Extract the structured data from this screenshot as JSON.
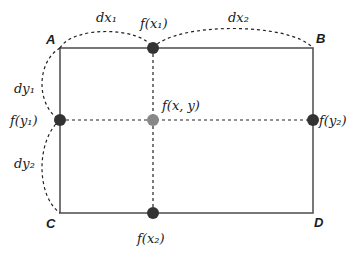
{
  "diagram": {
    "corners": {
      "A": "A",
      "B": "B",
      "C": "C",
      "D": "D"
    },
    "points": {
      "top": "f(x₁)",
      "bottom": "f(x₂)",
      "left": "f(y₁)",
      "right": "f(y₂)",
      "center": "f(x, y)"
    },
    "distances": {
      "dx1": "dx₁",
      "dx2": "dx₂",
      "dy1": "dy₁",
      "dy2": "dy₂"
    },
    "colors": {
      "rect_line": "#555555",
      "dashed": "#222222",
      "dot_dark": "#333333",
      "dot_center": "#888888"
    }
  }
}
